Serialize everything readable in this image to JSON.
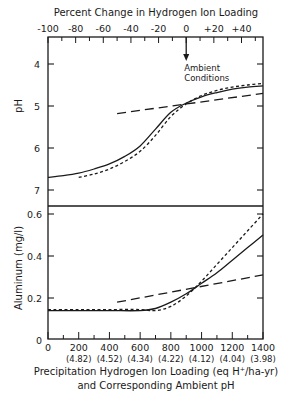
{
  "chart_data": [
    {
      "type": "line",
      "panel": "pH",
      "top_axis": {
        "title": "Percent Change in Hydrogen Ion Loading",
        "tick_labels": [
          "-100",
          "-80",
          "-60",
          "-40",
          "-20",
          "0",
          "+20",
          "+40"
        ],
        "tick_values": [
          -100,
          -80,
          -60,
          -40,
          -20,
          0,
          20,
          40
        ]
      },
      "annotation": {
        "text_line1": "Ambient",
        "text_line2": "Conditions",
        "x": 900
      },
      "ylabel": "pH",
      "ylim": [
        3.4,
        7.4
      ],
      "y_inverted": true,
      "yticks": [
        4,
        5,
        6,
        7
      ],
      "ytick_labels": [
        "4",
        "5",
        "6",
        "7"
      ],
      "xlim": [
        0,
        1400
      ],
      "series": [
        {
          "name": "solid",
          "style": "solid",
          "x": [
            0,
            100,
            200,
            300,
            400,
            500,
            600,
            700,
            800,
            900,
            1000,
            1100,
            1200,
            1300,
            1400
          ],
          "y": [
            6.7,
            6.66,
            6.6,
            6.5,
            6.38,
            6.2,
            5.95,
            5.55,
            5.15,
            4.93,
            4.78,
            4.68,
            4.6,
            4.55,
            4.52
          ]
        },
        {
          "name": "short-dash",
          "style": "short-dash",
          "x": [
            200,
            300,
            400,
            500,
            600,
            700,
            800,
            900,
            1000,
            1100,
            1200,
            1300,
            1400
          ],
          "y": [
            6.7,
            6.62,
            6.5,
            6.32,
            6.08,
            5.7,
            5.25,
            4.95,
            4.75,
            4.63,
            4.55,
            4.5,
            4.46
          ]
        },
        {
          "name": "long-dash",
          "style": "long-dash",
          "x": [
            450,
            1400
          ],
          "y": [
            5.18,
            4.7
          ]
        }
      ]
    },
    {
      "type": "line",
      "panel": "aluminum",
      "ylabel": "Aluminum (mg/l)",
      "ylim": [
        0,
        0.65
      ],
      "yticks": [
        0,
        0.2,
        0.4,
        0.6
      ],
      "ytick_labels": [
        "0",
        "0.2",
        "0.4",
        "0.6"
      ],
      "xlim": [
        0,
        1400
      ],
      "xticks": [
        0,
        200,
        400,
        600,
        800,
        1000,
        1200,
        1400
      ],
      "xtick_labels": [
        "0",
        "200",
        "400",
        "600",
        "800",
        "1000",
        "1200",
        "1400"
      ],
      "xtick_sublabels": [
        "",
        "(4.82)",
        "(4.52)",
        "(4.34)",
        "(4.22)",
        "(4.12)",
        "(4.04)",
        "(3.98)"
      ],
      "xlabel_line1": "Precipitation Hydrogen Ion Loading (eq H⁺/ha-yr)",
      "xlabel_line2": "and Corresponding Ambient  pH",
      "series": [
        {
          "name": "solid",
          "style": "solid",
          "x": [
            0,
            200,
            400,
            600,
            700,
            800,
            900,
            1000,
            1100,
            1200,
            1300,
            1400
          ],
          "y": [
            0.14,
            0.14,
            0.14,
            0.14,
            0.15,
            0.18,
            0.22,
            0.27,
            0.32,
            0.38,
            0.44,
            0.5
          ]
        },
        {
          "name": "short-dash",
          "style": "short-dash",
          "x": [
            0,
            200,
            400,
            600,
            700,
            800,
            900,
            1000,
            1100,
            1200,
            1300,
            1400
          ],
          "y": [
            0.145,
            0.145,
            0.145,
            0.145,
            0.14,
            0.16,
            0.21,
            0.28,
            0.36,
            0.44,
            0.52,
            0.6
          ]
        },
        {
          "name": "long-dash",
          "style": "long-dash",
          "x": [
            450,
            1400
          ],
          "y": [
            0.18,
            0.31
          ]
        }
      ]
    }
  ]
}
